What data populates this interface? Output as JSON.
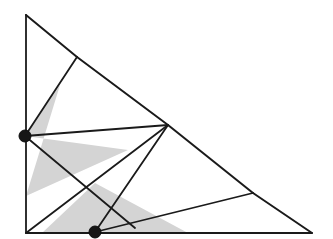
{
  "figure": {
    "canvas": {
      "width": 333,
      "height": 239,
      "background": "#ffffff"
    },
    "colors": {
      "edge_stroke": "#1a1a1a",
      "vertex_fill": "#161616",
      "wedge_fill": "#d4d4d4",
      "background": "#ffffff"
    },
    "points": {
      "apex": {
        "name": "apex-vertex",
        "x": 26,
        "y": 15
      },
      "bottom_left": {
        "name": "bottom-left-corner",
        "x": 26,
        "y": 233
      },
      "bottom_right": {
        "name": "bottom-right-corner",
        "x": 312,
        "y": 233
      },
      "upper_hyp": {
        "name": "upper-hypotenuse-node",
        "x": 77,
        "y": 57
      },
      "lower_hyp": {
        "name": "lower-hypotenuse-node",
        "x": 253,
        "y": 193
      },
      "hub": {
        "name": "interior-hub-vertex",
        "x": 168,
        "y": 125
      },
      "left_marked": {
        "name": "left-marked-vertex",
        "x": 25,
        "y": 136
      },
      "bottom_marked": {
        "name": "bottom-marked-vertex",
        "x": 95,
        "y": 232
      }
    },
    "edges": [
      {
        "id": "boundary-left",
        "x1": 26,
        "y1": 15,
        "x2": 26,
        "y2": 233,
        "width": 1.8
      },
      {
        "id": "boundary-bottom",
        "x1": 26,
        "y1": 233,
        "x2": 312,
        "y2": 233,
        "width": 1.8
      },
      {
        "id": "hypotenuse-upper",
        "x1": 26,
        "y1": 15,
        "x2": 77,
        "y2": 57,
        "width": 2.0
      },
      {
        "id": "hypotenuse-mid",
        "x1": 77,
        "y1": 57,
        "x2": 168,
        "y2": 125,
        "width": 2.0
      },
      {
        "id": "hypotenuse-mid2",
        "x1": 168,
        "y1": 125,
        "x2": 253,
        "y2": 193,
        "width": 2.0
      },
      {
        "id": "hypotenuse-lower",
        "x1": 253,
        "y1": 193,
        "x2": 312,
        "y2": 233,
        "width": 2.0
      },
      {
        "id": "diag-upper-to-left",
        "x1": 77,
        "y1": 57,
        "x2": 25,
        "y2": 136,
        "width": 1.8
      },
      {
        "id": "diag-left-to-hub",
        "x1": 25,
        "y1": 136,
        "x2": 168,
        "y2": 125,
        "width": 1.8
      },
      {
        "id": "diag-left-to-bottomr",
        "x1": 25,
        "y1": 136,
        "x2": 135,
        "y2": 228,
        "width": 1.8
      },
      {
        "id": "diag-hub-to-marked",
        "x1": 168,
        "y1": 125,
        "x2": 95,
        "y2": 232,
        "width": 1.8
      },
      {
        "id": "diag-hub-to-blcorner",
        "x1": 168,
        "y1": 125,
        "x2": 26,
        "y2": 233,
        "width": 1.8
      },
      {
        "id": "diag-marked-to-lower",
        "x1": 95,
        "y1": 232,
        "x2": 253,
        "y2": 193,
        "width": 1.8
      }
    ],
    "wedges": [
      {
        "id": "left-visibility-cone",
        "apex_x": 25,
        "apex_y": 136,
        "p1_x": 60,
        "p1_y": 85,
        "p2_x": 128,
        "p2_y": 150,
        "tail_x": 26,
        "tail_y": 196
      },
      {
        "id": "bottom-visibility-cone",
        "apex_x": 95,
        "apex_y": 232,
        "p1_x": 42,
        "p1_y": 233,
        "p2_x": 188,
        "p2_y": 233,
        "tail_x": 95,
        "tail_y": 183
      }
    ]
  }
}
